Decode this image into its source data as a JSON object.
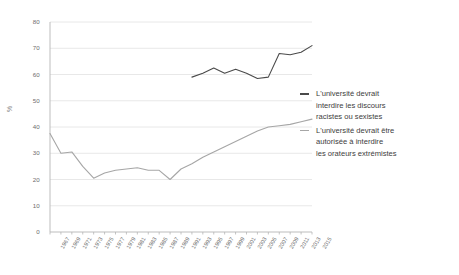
{
  "chart_data": {
    "type": "line",
    "title": "",
    "xlabel": "",
    "ylabel": "%",
    "ylim": [
      0,
      80
    ],
    "ytick_step": 10,
    "yticks": [
      "0",
      "10",
      "20",
      "30",
      "40",
      "50",
      "60",
      "70",
      "80"
    ],
    "grid": true,
    "legend_position": "right",
    "x": [
      1967,
      1969,
      1971,
      1973,
      1975,
      1977,
      1979,
      1981,
      1983,
      1985,
      1987,
      1989,
      1991,
      1993,
      1995,
      1997,
      1999,
      2001,
      2003,
      2005,
      2007,
      2009,
      2011,
      2013,
      2015
    ],
    "xtick_labels": [
      "1967",
      "1969",
      "1971",
      "1973",
      "1975",
      "1977",
      "1979",
      "1981",
      "1983",
      "1985",
      "1987",
      "1989",
      "1991",
      "1993",
      "1995",
      "1997",
      "1999",
      "2001",
      "2003",
      "2005",
      "2007",
      "2009",
      "2011",
      "2013",
      "2015"
    ],
    "series": [
      {
        "name": "L'université devrait interdire les discours racistes ou sexistes",
        "color": "#4a4a4a",
        "values": [
          null,
          null,
          null,
          null,
          null,
          null,
          null,
          null,
          null,
          null,
          null,
          null,
          null,
          59,
          60.5,
          62.5,
          60.5,
          62,
          60.5,
          58.5,
          59,
          68,
          67.5,
          68.5,
          71
        ]
      },
      {
        "name": "L'université devrait être autorisée à interdire les orateurs extrémistes",
        "color": "#a6a6a6",
        "values": [
          37.5,
          30,
          30.5,
          25,
          20.5,
          22.5,
          23.5,
          24,
          24.5,
          23.5,
          23.5,
          20,
          24,
          26,
          28.5,
          30.5,
          32.5,
          34.5,
          36.5,
          38.5,
          40,
          40.5,
          41,
          42,
          43
        ]
      }
    ]
  },
  "legend": {
    "entries": [
      {
        "line1": "L'université devrait",
        "line2": "interdire les discours",
        "line3": "racistes ou sexistes",
        "color": "#4a4a4a"
      },
      {
        "line1": "L'université devrait être",
        "line2": "autorisée à interdire",
        "line3": "les orateurs extrémistes",
        "color": "#a6a6a6"
      }
    ]
  },
  "axis": {
    "y_title": "%"
  }
}
